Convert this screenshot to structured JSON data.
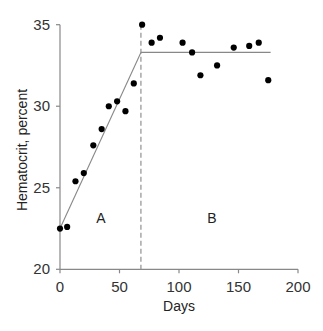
{
  "chart_data": {
    "type": "scatter",
    "title": "",
    "xlabel": "Days",
    "ylabel": "Hematocrit, percent",
    "xlim": [
      0,
      200
    ],
    "ylim": [
      20,
      35
    ],
    "x_ticks": [
      0,
      50,
      100,
      150,
      200
    ],
    "y_ticks": [
      20,
      25,
      30,
      35
    ],
    "grid": false,
    "legend": null,
    "series": [
      {
        "name": "Hematocrit measurements",
        "type": "scatter",
        "points": [
          {
            "x": 0,
            "y": 22.5
          },
          {
            "x": 6,
            "y": 22.6
          },
          {
            "x": 13,
            "y": 25.4
          },
          {
            "x": 20,
            "y": 25.9
          },
          {
            "x": 28,
            "y": 27.6
          },
          {
            "x": 35,
            "y": 28.6
          },
          {
            "x": 41,
            "y": 30.0
          },
          {
            "x": 48,
            "y": 30.3
          },
          {
            "x": 55,
            "y": 29.7
          },
          {
            "x": 62,
            "y": 31.4
          },
          {
            "x": 69,
            "y": 35.0
          },
          {
            "x": 77,
            "y": 33.9
          },
          {
            "x": 84,
            "y": 34.2
          },
          {
            "x": 103,
            "y": 33.9
          },
          {
            "x": 111,
            "y": 33.3
          },
          {
            "x": 118,
            "y": 31.9
          },
          {
            "x": 132,
            "y": 32.5
          },
          {
            "x": 146,
            "y": 33.6
          },
          {
            "x": 159,
            "y": 33.7
          },
          {
            "x": 167,
            "y": 33.9
          },
          {
            "x": 175,
            "y": 31.6
          }
        ]
      },
      {
        "name": "Fitted line (phase A: rising)",
        "type": "line",
        "points": [
          {
            "x": 0,
            "y": 22.5
          },
          {
            "x": 68,
            "y": 33.3
          }
        ]
      },
      {
        "name": "Fitted line (phase B: plateau)",
        "type": "line",
        "points": [
          {
            "x": 68,
            "y": 33.3
          },
          {
            "x": 177,
            "y": 33.3
          }
        ]
      }
    ],
    "annotations": [
      {
        "type": "vline",
        "x": 68,
        "style": "dashed"
      },
      {
        "type": "text",
        "text": "A",
        "x": 34,
        "y": 23.1
      },
      {
        "type": "text",
        "text": "B",
        "x": 127,
        "y": 23.1
      }
    ]
  },
  "labels": {
    "xlabel": "Days",
    "ylabel": "Hematocrit, percent",
    "region_a": "A",
    "region_b": "B",
    "xticks": [
      "0",
      "50",
      "100",
      "150",
      "200"
    ],
    "yticks": [
      "20",
      "25",
      "30",
      "35"
    ]
  },
  "colors": {
    "axis": "#888888",
    "fit_line": "#888888",
    "dashed_line": "#999999",
    "points": "#000000",
    "text": "#333333"
  }
}
